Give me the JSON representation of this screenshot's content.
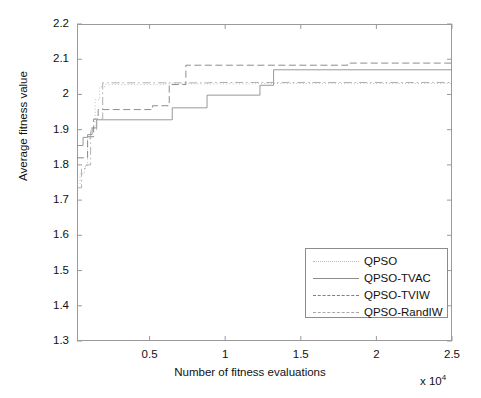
{
  "chart_data": {
    "type": "line",
    "title": "",
    "xlabel": "Number of fitness evaluations",
    "ylabel": "Average fitness value",
    "x_multiplier": "x 10",
    "x_multiplier_exp": "4",
    "xlim": [
      200,
      25000
    ],
    "ylim": [
      1.3,
      2.2
    ],
    "xticks": [
      0.5,
      1,
      1.5,
      2,
      2.5
    ],
    "xtick_labels": [
      "0.5",
      "1",
      "1.5",
      "2",
      "2.5"
    ],
    "yticks": [
      1.3,
      1.4,
      1.5,
      1.6,
      1.7,
      1.8,
      1.9,
      2.0,
      2.1,
      2.2
    ],
    "ytick_labels": [
      "1.3",
      "1.4",
      "1.5",
      "1.6",
      "1.7",
      "1.8",
      "1.9",
      "2",
      "2.1",
      "2.2"
    ],
    "grid": false,
    "legend_position": "lower-right",
    "series": [
      {
        "name": "QPSO",
        "style": "dotted",
        "color": "#b9b9b9",
        "points": [
          [
            200,
            1.745
          ],
          [
            400,
            1.745
          ],
          [
            400,
            1.775
          ],
          [
            700,
            1.775
          ],
          [
            700,
            1.795
          ],
          [
            900,
            1.795
          ],
          [
            900,
            1.875
          ],
          [
            1100,
            1.875
          ],
          [
            1100,
            1.905
          ],
          [
            1400,
            1.905
          ],
          [
            1400,
            1.985
          ],
          [
            1700,
            1.985
          ],
          [
            1700,
            2.022
          ],
          [
            2100,
            2.022
          ],
          [
            2100,
            2.028
          ],
          [
            6000,
            2.028
          ],
          [
            6000,
            2.03
          ],
          [
            12000,
            2.03
          ],
          [
            12000,
            2.031
          ],
          [
            25000,
            2.031
          ]
        ]
      },
      {
        "name": "QPSO-TVAC",
        "style": "solid",
        "color": "#8d8d8d",
        "points": [
          [
            200,
            1.855
          ],
          [
            600,
            1.855
          ],
          [
            600,
            1.878
          ],
          [
            900,
            1.878
          ],
          [
            900,
            1.886
          ],
          [
            1200,
            1.886
          ],
          [
            1200,
            1.905
          ],
          [
            1500,
            1.905
          ],
          [
            1500,
            1.928
          ],
          [
            6500,
            1.928
          ],
          [
            6500,
            1.962
          ],
          [
            8800,
            1.962
          ],
          [
            8800,
            1.998
          ],
          [
            12300,
            1.998
          ],
          [
            12300,
            2.026
          ],
          [
            13200,
            2.026
          ],
          [
            13200,
            2.07
          ],
          [
            25000,
            2.07
          ]
        ]
      },
      {
        "name": "QPSO-TVIW",
        "style": "dashed",
        "color": "#7f7f7f",
        "points": [
          [
            200,
            1.82
          ],
          [
            900,
            1.82
          ],
          [
            900,
            1.88
          ],
          [
            1300,
            1.88
          ],
          [
            1300,
            1.93
          ],
          [
            1600,
            1.93
          ],
          [
            1600,
            1.957
          ],
          [
            5200,
            1.957
          ],
          [
            5200,
            1.968
          ],
          [
            6300,
            1.968
          ],
          [
            6300,
            2.028
          ],
          [
            7400,
            2.028
          ],
          [
            7400,
            2.083
          ],
          [
            18100,
            2.083
          ],
          [
            18100,
            2.089
          ],
          [
            25000,
            2.089
          ]
        ]
      },
      {
        "name": "QPSO-RandIW",
        "style": "dashdot",
        "color": "#a8a8a8",
        "points": [
          [
            200,
            1.735
          ],
          [
            500,
            1.735
          ],
          [
            500,
            1.79
          ],
          [
            800,
            1.79
          ],
          [
            800,
            1.8
          ],
          [
            1100,
            1.8
          ],
          [
            1100,
            1.898
          ],
          [
            1500,
            1.898
          ],
          [
            1500,
            1.93
          ],
          [
            1900,
            1.93
          ],
          [
            1900,
            2.033
          ],
          [
            9000,
            2.033
          ],
          [
            9000,
            2.034
          ],
          [
            25000,
            2.034
          ]
        ]
      }
    ]
  },
  "legend": {
    "items": [
      {
        "label": "QPSO",
        "style": "dotted"
      },
      {
        "label": "QPSO-TVAC",
        "style": "solid"
      },
      {
        "label": "QPSO-TVIW",
        "style": "dashed"
      },
      {
        "label": "QPSO-RandIW",
        "style": "dashdot"
      }
    ]
  }
}
